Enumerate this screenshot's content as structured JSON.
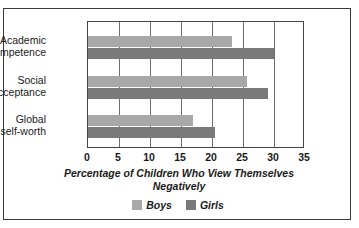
{
  "chart_data": {
    "type": "bar",
    "orientation": "horizontal",
    "title": "",
    "xlabel": "Percentage of Children Who View Themselves Negatively",
    "ylabel": "",
    "xlim": [
      0,
      35
    ],
    "xticks": [
      0,
      5,
      10,
      15,
      20,
      25,
      30,
      35
    ],
    "grid": true,
    "legend_position": "bottom",
    "categories": [
      "Academic competence",
      "Social acceptance",
      "Global self-worth"
    ],
    "category_lines": [
      [
        "Academic",
        "competence"
      ],
      [
        "Social",
        "acceptance"
      ],
      [
        "Global",
        "self-worth"
      ]
    ],
    "series": [
      {
        "name": "Boys",
        "color": "#a8a8a8",
        "values": [
          23.2,
          25.7,
          17.0
        ]
      },
      {
        "name": "Girls",
        "color": "#7a7a7a",
        "values": [
          30.0,
          29.0,
          20.5
        ]
      }
    ]
  },
  "axis_title_lines": [
    "Percentage of Children Who View Themselves",
    "Negatively"
  ],
  "colors": {
    "boys": "#a8a8a8",
    "girls": "#7a7a7a",
    "frame": "#3a3a3a",
    "gridline": "#6f6f6f",
    "background": "#ffffff"
  }
}
